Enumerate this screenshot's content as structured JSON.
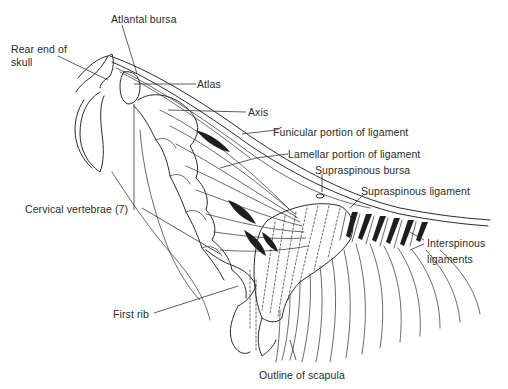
{
  "diagram": {
    "type": "anatomical illustration",
    "labels": {
      "atlantal_bursa": "Atlantal bursa",
      "rear_end_of_skull_line1": "Rear end of",
      "rear_end_of_skull_line2": "skull",
      "atlas": "Atlas",
      "axis": "Axis",
      "funicular_portion": "Funicular portion of ligament",
      "lamellar_portion": "Lamellar portion of ligament",
      "supraspinous_bursa": "Supraspinous bursa",
      "supraspinous_ligament": "Supraspinous ligament",
      "cervical_vertebrae": "Cervical vertebrae (7)",
      "interspinous_line1": "Interspinous",
      "interspinous_line2": "ligaments",
      "first_rib": "First rib",
      "outline_of_scapula": "Outline of scapula"
    },
    "colors": {
      "ink": "#2b2b2b",
      "background": "#ffffff"
    }
  }
}
